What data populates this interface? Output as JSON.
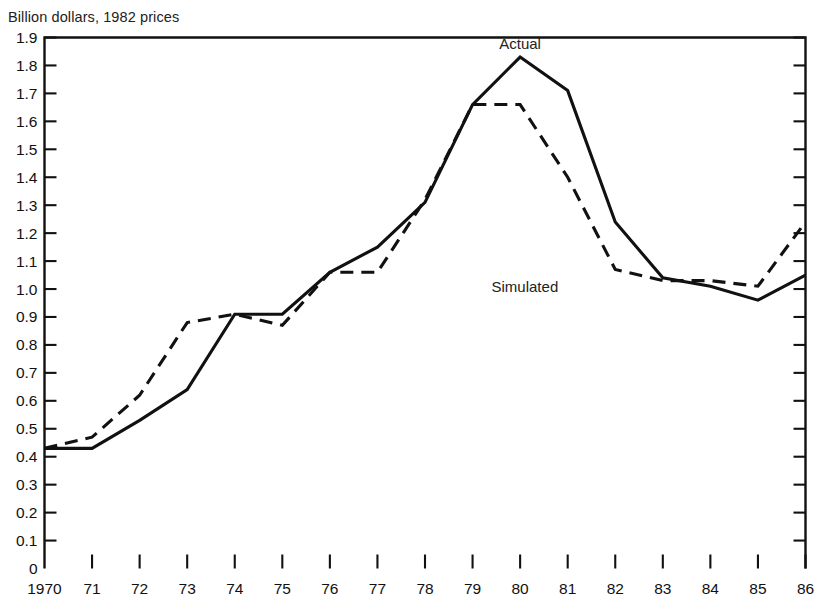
{
  "chart_data": {
    "type": "line",
    "title": "Billion dollars, 1982 prices",
    "xlabel": "",
    "ylabel": "",
    "grid": false,
    "legend_position": "inline-annotation",
    "xlim": [
      1970,
      1986
    ],
    "ylim": [
      0,
      1.9
    ],
    "x": [
      1970,
      1971,
      1972,
      1973,
      1974,
      1975,
      1976,
      1977,
      1978,
      1979,
      1980,
      1981,
      1982,
      1983,
      1984,
      1985,
      1986
    ],
    "x_tick_labels": [
      "1970",
      "71",
      "72",
      "73",
      "74",
      "75",
      "76",
      "77",
      "78",
      "79",
      "80",
      "81",
      "82",
      "83",
      "84",
      "85",
      "86"
    ],
    "y_tick_labels": [
      "0",
      "0.1",
      "0.2",
      "0.3",
      "0.4",
      "0.5",
      "0.6",
      "0.7",
      "0.8",
      "0.9",
      "1.0",
      "1.1",
      "1.2",
      "1.3",
      "1.4",
      "1.5",
      "1.6",
      "1.7",
      "1.8",
      "1.9"
    ],
    "y_tick_values": [
      0,
      0.1,
      0.2,
      0.3,
      0.4,
      0.5,
      0.6,
      0.7,
      0.8,
      0.9,
      1.0,
      1.1,
      1.2,
      1.3,
      1.4,
      1.5,
      1.6,
      1.7,
      1.8,
      1.9
    ],
    "series": [
      {
        "name": "Actual",
        "style": "solid",
        "color": "#111111",
        "label_x": 1980.0,
        "label_y": 1.86,
        "values": [
          0.43,
          0.43,
          0.53,
          0.64,
          0.91,
          0.91,
          1.06,
          1.15,
          1.31,
          1.66,
          1.83,
          1.71,
          1.24,
          1.04,
          1.01,
          0.96,
          1.05
        ]
      },
      {
        "name": "Simulated",
        "style": "dashed",
        "color": "#111111",
        "label_x": 1980.1,
        "label_y": 0.99,
        "values": [
          0.43,
          0.47,
          0.62,
          0.88,
          0.91,
          0.87,
          1.06,
          1.06,
          1.32,
          1.66,
          1.66,
          1.4,
          1.07,
          1.03,
          1.03,
          1.01,
          1.24
        ]
      }
    ]
  }
}
